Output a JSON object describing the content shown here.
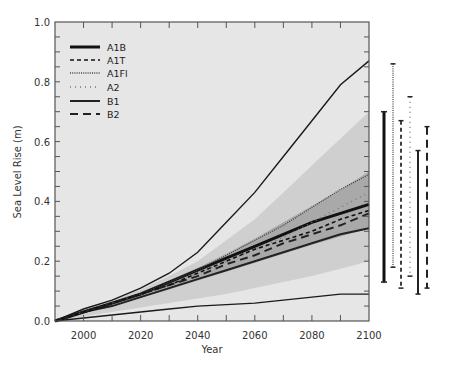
{
  "chart_data": {
    "type": "line",
    "title": "",
    "xlabel": "Year",
    "ylabel": "Sea Level Rise (m)",
    "xlim": [
      1990,
      2100
    ],
    "ylim": [
      0.0,
      1.0
    ],
    "xticks": [
      2000,
      2020,
      2040,
      2060,
      2080,
      2100
    ],
    "xtick_labels": [
      "2000",
      "2020",
      "2040",
      "2060",
      "2080",
      "2100"
    ],
    "yticks": [
      0.0,
      0.2,
      0.4,
      0.6,
      0.8,
      1.0
    ],
    "ytick_labels": [
      "0.0",
      "0.2",
      "0.4",
      "0.6",
      "0.8",
      "1.0"
    ],
    "grid": false,
    "legend_position": "upper left",
    "x": [
      1990,
      2000,
      2010,
      2020,
      2030,
      2040,
      2050,
      2060,
      2070,
      2080,
      2090,
      2100
    ],
    "series": [
      {
        "name": "A1B",
        "style": "thick-solid",
        "values": [
          0.0,
          0.03,
          0.06,
          0.09,
          0.13,
          0.17,
          0.21,
          0.25,
          0.29,
          0.33,
          0.36,
          0.39
        ]
      },
      {
        "name": "A1T",
        "style": "short-dash",
        "values": [
          0.0,
          0.03,
          0.06,
          0.09,
          0.12,
          0.16,
          0.2,
          0.24,
          0.27,
          0.3,
          0.34,
          0.37
        ]
      },
      {
        "name": "A1FI",
        "style": "dotted",
        "values": [
          0.0,
          0.03,
          0.06,
          0.09,
          0.13,
          0.17,
          0.22,
          0.27,
          0.32,
          0.38,
          0.44,
          0.49
        ]
      },
      {
        "name": "A2",
        "style": "sparse-dotted",
        "values": [
          0.0,
          0.03,
          0.06,
          0.09,
          0.12,
          0.16,
          0.2,
          0.24,
          0.28,
          0.33,
          0.38,
          0.43
        ]
      },
      {
        "name": "B1",
        "style": "solid",
        "values": [
          0.0,
          0.03,
          0.05,
          0.08,
          0.11,
          0.14,
          0.17,
          0.2,
          0.23,
          0.26,
          0.29,
          0.31
        ]
      },
      {
        "name": "B2",
        "style": "long-dash",
        "values": [
          0.0,
          0.03,
          0.06,
          0.09,
          0.12,
          0.15,
          0.19,
          0.22,
          0.26,
          0.29,
          0.32,
          0.36
        ]
      }
    ],
    "envelopes": [
      {
        "name": "full-range-upper",
        "style": "thin-solid",
        "values": [
          0.0,
          0.04,
          0.07,
          0.11,
          0.16,
          0.23,
          0.33,
          0.43,
          0.55,
          0.67,
          0.79,
          0.87
        ]
      },
      {
        "name": "full-range-lower",
        "style": "thin-solid",
        "values": [
          0.0,
          0.01,
          0.02,
          0.03,
          0.04,
          0.05,
          0.055,
          0.06,
          0.07,
          0.08,
          0.09,
          0.09
        ]
      }
    ],
    "bands": [
      {
        "name": "outer-light-band",
        "color": "#cfcfcf",
        "upper": [
          0.0,
          0.035,
          0.07,
          0.105,
          0.15,
          0.2,
          0.27,
          0.34,
          0.43,
          0.52,
          0.61,
          0.7
        ],
        "lower": [
          0.0,
          0.015,
          0.03,
          0.045,
          0.06,
          0.075,
          0.09,
          0.11,
          0.13,
          0.15,
          0.175,
          0.2
        ]
      },
      {
        "name": "inner-medium-band",
        "color": "#a9a9a9",
        "upper": [
          0.0,
          0.032,
          0.064,
          0.097,
          0.135,
          0.178,
          0.225,
          0.275,
          0.33,
          0.385,
          0.44,
          0.5
        ],
        "lower": [
          0.0,
          0.028,
          0.052,
          0.078,
          0.105,
          0.135,
          0.165,
          0.195,
          0.225,
          0.255,
          0.283,
          0.31
        ]
      }
    ],
    "range_bars_2100": [
      {
        "name": "A1B",
        "style": "thick-solid",
        "low": 0.13,
        "high": 0.7
      },
      {
        "name": "A1FI",
        "style": "dotted",
        "low": 0.18,
        "high": 0.86
      },
      {
        "name": "A1T",
        "style": "short-dash",
        "low": 0.11,
        "high": 0.67
      },
      {
        "name": "A2",
        "style": "sparse-dotted",
        "low": 0.15,
        "high": 0.75
      },
      {
        "name": "B1",
        "style": "solid",
        "low": 0.09,
        "high": 0.57
      },
      {
        "name": "B2",
        "style": "long-dash",
        "low": 0.11,
        "high": 0.65
      }
    ]
  },
  "legend": {
    "items": [
      {
        "label": "A1B",
        "style": "thick-solid"
      },
      {
        "label": "A1T",
        "style": "short-dash"
      },
      {
        "label": "A1Fl",
        "style": "dotted"
      },
      {
        "label": "A2",
        "style": "sparse-dotted"
      },
      {
        "label": "B1",
        "style": "solid"
      },
      {
        "label": "B2",
        "style": "long-dash"
      }
    ]
  },
  "axes": {
    "xlabel": "Year",
    "ylabel": "Sea Level Rise (m)"
  },
  "colors": {
    "plot_background": "#e6e6e6",
    "outer_band": "#cfcfcf",
    "inner_band": "#a9a9a9",
    "line": "#1a1a1a",
    "axis": "#555555"
  }
}
